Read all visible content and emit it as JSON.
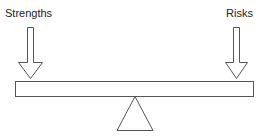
{
  "diagram": {
    "type": "balance-scale",
    "labels": {
      "left": "Strengths",
      "right": "Risks"
    },
    "colors": {
      "stroke": "#555555",
      "fill": "#ffffff",
      "text": "#222222"
    }
  }
}
